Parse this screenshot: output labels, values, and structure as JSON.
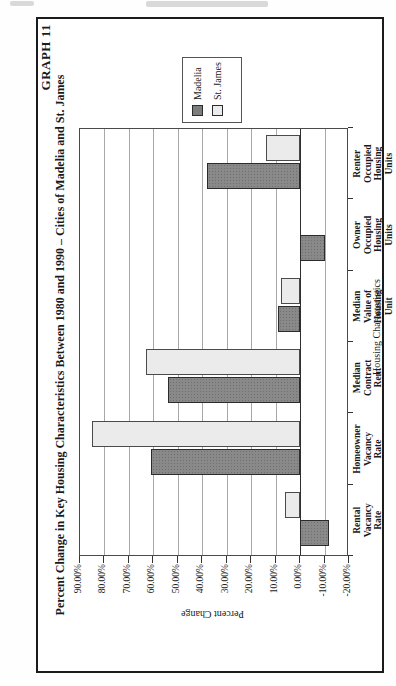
{
  "chart_data": {
    "type": "bar",
    "title": "GRAPH 11",
    "subtitle": "Percent Change in Key Housing Characteristics Between 1980 and 1990 – Cities of Madelia and St. James",
    "xlabel": "Housing Characteristics",
    "ylabel": "Percent Change",
    "ylim": [
      -20,
      90
    ],
    "ytick_step": 10,
    "grid": true,
    "legend_position": "right-of-plot (appears at top after 90° CCW page rotation)",
    "note": "Landscape column chart printed rotated 90° counterclockwise on a portrait page",
    "categories": [
      "Rental Vacancy Rate",
      "Homeowner Vacancy Rate",
      "Median Contract Rent",
      "Median Value of Housing Unit",
      "Owner Occupied Housing Units",
      "Renter Occupied Housing Units"
    ],
    "category_label_lines": [
      [
        "Rental",
        "Vacancy",
        "Rate"
      ],
      [
        "Homeowner",
        "Vacancy",
        "Rate"
      ],
      [
        "Median",
        "Contract",
        "Rent"
      ],
      [
        "Median",
        "Value of",
        "Housing",
        "Unit"
      ],
      [
        "Owner",
        "Occupied",
        "Housing",
        "Units"
      ],
      [
        "Renter",
        "Occupied",
        "Housing",
        "Units"
      ]
    ],
    "ytick_labels": [
      "90.00%",
      "80.00%",
      "70.00%",
      "60.00%",
      "50.00%",
      "40.00%",
      "30.00%",
      "20.00%",
      "10.00%",
      "0.00%",
      "-10.00%",
      "-20.00%"
    ],
    "series": [
      {
        "name": "Madelia",
        "color": "#898989",
        "values": [
          -12,
          61,
          54,
          9,
          -10,
          38
        ]
      },
      {
        "name": "St. James",
        "color": "#ececeb",
        "values": [
          6,
          85,
          63,
          8,
          0,
          14
        ]
      }
    ]
  }
}
